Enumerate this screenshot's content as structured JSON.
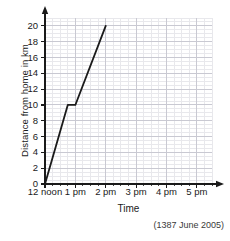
{
  "chart_data": {
    "type": "line",
    "title": "",
    "xlabel": "Time",
    "ylabel": "Distance from home in km",
    "attribution": "(1387 June 2005)",
    "xlim": [
      0,
      5.5
    ],
    "ylim": [
      0,
      21
    ],
    "grid": true,
    "legend": "none",
    "x_tick_labels": [
      "12 noon",
      "1 pm",
      "2 pm",
      "3 pm",
      "4 pm",
      "5 pm"
    ],
    "x_tick_values": [
      0,
      1,
      2,
      3,
      4,
      5
    ],
    "y_tick_labels": [
      "0",
      "2",
      "4",
      "6",
      "8",
      "10",
      "12",
      "14",
      "16",
      "18",
      "20"
    ],
    "y_tick_values": [
      0,
      2,
      4,
      6,
      8,
      10,
      12,
      14,
      16,
      18,
      20
    ],
    "minor_grid_step_x": 0.25,
    "minor_grid_step_y": 0.5,
    "series": [
      {
        "name": "Journey",
        "color": "#1a1a1a",
        "points": [
          {
            "x": 0.0,
            "y": 0,
            "time": "12 noon",
            "distance_km": 0
          },
          {
            "x": 0.75,
            "y": 10,
            "time": "12:45 pm",
            "distance_km": 10
          },
          {
            "x": 1.0,
            "y": 10,
            "time": "1 pm",
            "distance_km": 10
          },
          {
            "x": 2.0,
            "y": 20,
            "time": "2 pm",
            "distance_km": 20
          }
        ]
      }
    ]
  },
  "axes": {
    "y_title": "Distance from home in km",
    "x_title": "Time",
    "attribution": "(1387 June 2005)"
  },
  "colors": {
    "line": "#1a1a1a",
    "axis": "#1a1a1a",
    "grid_minor": "#e8e8ec",
    "grid_major": "#c9c9d2",
    "background": "#ffffff"
  }
}
